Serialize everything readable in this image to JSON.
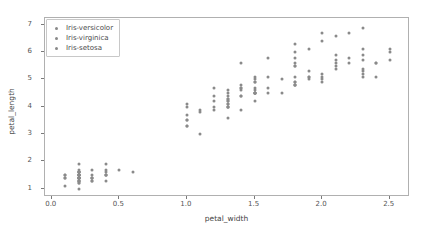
{
  "chart_data": {
    "type": "scatter",
    "title": "",
    "xlabel": "petal_width",
    "ylabel": "petal_length",
    "xlim": [
      -0.05,
      2.65
    ],
    "ylim": [
      0.7,
      7.25
    ],
    "xticks": [
      "0.0",
      "0.5",
      "1.0",
      "1.5",
      "2.0",
      "2.5"
    ],
    "xtick_values": [
      0.0,
      0.5,
      1.0,
      1.5,
      2.0,
      2.5
    ],
    "yticks": [
      "1",
      "2",
      "3",
      "4",
      "5",
      "6",
      "7"
    ],
    "ytick_values": [
      1,
      2,
      3,
      4,
      5,
      6,
      7
    ],
    "grid": false,
    "legend_position": "upper left",
    "marker_color": "#8a8a8a",
    "series": [
      {
        "name": "Iris-versicolor",
        "color": "#8a8a8a",
        "points": [
          [
            1.4,
            4.7
          ],
          [
            1.5,
            4.5
          ],
          [
            1.5,
            4.9
          ],
          [
            1.3,
            4.0
          ],
          [
            1.5,
            4.6
          ],
          [
            1.3,
            4.5
          ],
          [
            1.6,
            4.7
          ],
          [
            1.0,
            3.3
          ],
          [
            1.3,
            4.6
          ],
          [
            1.4,
            3.9
          ],
          [
            1.0,
            3.5
          ],
          [
            1.5,
            4.2
          ],
          [
            1.0,
            4.0
          ],
          [
            1.4,
            4.7
          ],
          [
            1.3,
            3.6
          ],
          [
            1.4,
            4.4
          ],
          [
            1.5,
            4.5
          ],
          [
            1.0,
            4.1
          ],
          [
            1.5,
            4.5
          ],
          [
            1.1,
            3.9
          ],
          [
            1.8,
            4.8
          ],
          [
            1.3,
            4.0
          ],
          [
            1.5,
            4.9
          ],
          [
            1.2,
            4.7
          ],
          [
            1.3,
            4.3
          ],
          [
            1.4,
            4.4
          ],
          [
            1.4,
            4.8
          ],
          [
            1.7,
            5.0
          ],
          [
            1.5,
            4.5
          ],
          [
            1.0,
            3.5
          ],
          [
            1.1,
            3.8
          ],
          [
            1.0,
            3.7
          ],
          [
            1.2,
            3.9
          ],
          [
            1.6,
            5.1
          ],
          [
            1.5,
            4.5
          ],
          [
            1.6,
            4.5
          ],
          [
            1.5,
            4.7
          ],
          [
            1.3,
            4.4
          ],
          [
            1.3,
            4.1
          ],
          [
            1.3,
            4.0
          ],
          [
            1.2,
            4.4
          ],
          [
            1.4,
            4.6
          ],
          [
            1.2,
            4.0
          ],
          [
            1.0,
            3.3
          ],
          [
            1.3,
            4.2
          ],
          [
            1.2,
            4.2
          ],
          [
            1.3,
            4.2
          ],
          [
            1.3,
            4.3
          ],
          [
            1.1,
            3.0
          ],
          [
            1.3,
            4.1
          ]
        ]
      },
      {
        "name": "Iris-virginica",
        "color": "#8a8a8a",
        "points": [
          [
            2.5,
            6.0
          ],
          [
            1.9,
            5.1
          ],
          [
            2.1,
            5.9
          ],
          [
            1.8,
            5.6
          ],
          [
            2.2,
            5.8
          ],
          [
            2.1,
            6.6
          ],
          [
            1.7,
            4.5
          ],
          [
            1.8,
            6.3
          ],
          [
            1.8,
            5.8
          ],
          [
            2.5,
            6.1
          ],
          [
            2.0,
            5.1
          ],
          [
            1.9,
            5.3
          ],
          [
            2.1,
            5.5
          ],
          [
            2.0,
            5.0
          ],
          [
            2.4,
            5.1
          ],
          [
            2.3,
            5.3
          ],
          [
            1.8,
            5.5
          ],
          [
            2.2,
            6.7
          ],
          [
            2.3,
            6.9
          ],
          [
            1.5,
            5.0
          ],
          [
            2.3,
            5.7
          ],
          [
            2.0,
            4.9
          ],
          [
            2.0,
            6.7
          ],
          [
            1.8,
            4.9
          ],
          [
            2.1,
            5.7
          ],
          [
            1.8,
            6.0
          ],
          [
            1.8,
            4.8
          ],
          [
            1.8,
            4.9
          ],
          [
            2.1,
            5.6
          ],
          [
            1.6,
            5.8
          ],
          [
            1.9,
            6.1
          ],
          [
            2.0,
            6.4
          ],
          [
            2.2,
            5.6
          ],
          [
            1.5,
            5.1
          ],
          [
            1.4,
            5.6
          ],
          [
            2.3,
            6.1
          ],
          [
            2.4,
            5.6
          ],
          [
            1.8,
            5.5
          ],
          [
            1.8,
            4.8
          ],
          [
            2.1,
            5.4
          ],
          [
            2.4,
            5.6
          ],
          [
            2.3,
            5.1
          ],
          [
            1.9,
            5.1
          ],
          [
            2.3,
            5.9
          ],
          [
            2.5,
            5.7
          ],
          [
            2.3,
            5.2
          ],
          [
            1.9,
            5.0
          ],
          [
            2.0,
            5.2
          ],
          [
            2.3,
            5.4
          ],
          [
            1.8,
            5.1
          ]
        ]
      },
      {
        "name": "Iris-setosa",
        "color": "#8a8a8a",
        "points": [
          [
            0.2,
            1.4
          ],
          [
            0.2,
            1.4
          ],
          [
            0.2,
            1.3
          ],
          [
            0.2,
            1.5
          ],
          [
            0.2,
            1.4
          ],
          [
            0.4,
            1.7
          ],
          [
            0.3,
            1.4
          ],
          [
            0.2,
            1.5
          ],
          [
            0.2,
            1.4
          ],
          [
            0.1,
            1.5
          ],
          [
            0.2,
            1.5
          ],
          [
            0.2,
            1.6
          ],
          [
            0.1,
            1.4
          ],
          [
            0.1,
            1.1
          ],
          [
            0.2,
            1.2
          ],
          [
            0.4,
            1.5
          ],
          [
            0.4,
            1.3
          ],
          [
            0.3,
            1.4
          ],
          [
            0.3,
            1.7
          ],
          [
            0.3,
            1.5
          ],
          [
            0.2,
            1.7
          ],
          [
            0.4,
            1.5
          ],
          [
            0.2,
            1.0
          ],
          [
            0.5,
            1.7
          ],
          [
            0.2,
            1.9
          ],
          [
            0.2,
            1.6
          ],
          [
            0.4,
            1.6
          ],
          [
            0.2,
            1.5
          ],
          [
            0.2,
            1.4
          ],
          [
            0.2,
            1.6
          ],
          [
            0.2,
            1.6
          ],
          [
            0.4,
            1.5
          ],
          [
            0.1,
            1.5
          ],
          [
            0.2,
            1.4
          ],
          [
            0.2,
            1.5
          ],
          [
            0.2,
            1.2
          ],
          [
            0.2,
            1.3
          ],
          [
            0.1,
            1.4
          ],
          [
            0.2,
            1.3
          ],
          [
            0.2,
            1.5
          ],
          [
            0.3,
            1.3
          ],
          [
            0.3,
            1.3
          ],
          [
            0.2,
            1.3
          ],
          [
            0.6,
            1.6
          ],
          [
            0.4,
            1.9
          ],
          [
            0.3,
            1.4
          ],
          [
            0.2,
            1.6
          ],
          [
            0.2,
            1.4
          ],
          [
            0.2,
            1.5
          ],
          [
            0.2,
            1.4
          ]
        ]
      }
    ],
    "legend": [
      {
        "label": "Iris-versicolor",
        "color": "#8a8a8a"
      },
      {
        "label": "Iris-virginica",
        "color": "#8a8a8a"
      },
      {
        "label": "Iris-setosa",
        "color": "#8a8a8a"
      }
    ]
  }
}
